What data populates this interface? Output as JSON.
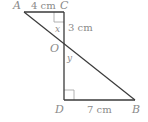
{
  "diagram": {
    "type": "geometry",
    "points": {
      "A": {
        "label": "A",
        "x": 24,
        "y": 12
      },
      "C": {
        "label": "C",
        "x": 64,
        "y": 12
      },
      "O": {
        "label": "O",
        "x": 64,
        "y": 45
      },
      "D": {
        "label": "D",
        "x": 64,
        "y": 100
      },
      "B": {
        "label": "B",
        "x": 135,
        "y": 100
      }
    },
    "segments": [
      {
        "from": "A",
        "to": "C"
      },
      {
        "from": "C",
        "to": "D"
      },
      {
        "from": "D",
        "to": "B"
      },
      {
        "from": "A",
        "to": "B"
      }
    ],
    "measurements": {
      "AC": "4 cm",
      "CO": "3 cm",
      "DB": "7 cm"
    },
    "angles": {
      "x": "x",
      "y": "y"
    },
    "right_angles": [
      "C",
      "D"
    ],
    "colors": {
      "line": "#3a3a3a",
      "marker": "#9a9a9a",
      "text": "#8a8a8a"
    }
  }
}
